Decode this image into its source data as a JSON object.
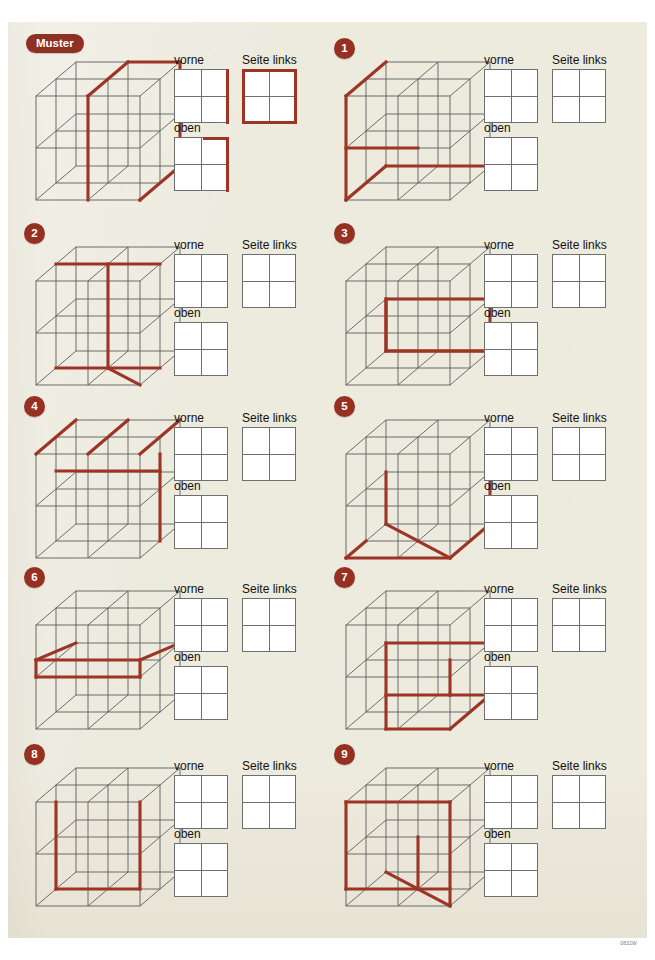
{
  "page": {
    "background_color": "#edeade",
    "accent_color": "#9c3526",
    "badge_color": "#963122",
    "line_color": "#5d5d5d",
    "footer_code": "0832W"
  },
  "labels": {
    "vorne": "vorne",
    "seite_links": "Seite links",
    "oben": "oben",
    "muster": "Muster"
  },
  "items": [
    {
      "id": "muster",
      "badge": "Muster",
      "badge_type": "pill",
      "description": "Example: a vertical slice plane through the cube is highlighted; the right face and a vertical mid-plane edge are traced in red.",
      "answers": {
        "vorne": {
          "edges": [
            "right"
          ]
        },
        "seite_links": {
          "edges": [
            "top",
            "right",
            "bottom",
            "left"
          ]
        },
        "oben": {
          "edges": [
            "tophalf-right",
            "right"
          ]
        }
      }
    },
    {
      "id": "1",
      "badge": "1",
      "badge_type": "circle",
      "description": "Red path along left-front vertical, mid horizontal to the right, and bottom front edge.",
      "answers": {
        "vorne": {
          "edges": []
        },
        "seite_links": {
          "edges": []
        },
        "oben": {
          "edges": []
        }
      }
    },
    {
      "id": "2",
      "badge": "2",
      "badge_type": "circle",
      "description": "Red path: upper horizontal across the top, central vertical down, lower horizontal and a diagonal depth edge.",
      "answers": {
        "vorne": {
          "edges": []
        },
        "seite_links": {
          "edges": []
        },
        "oben": {
          "edges": []
        }
      }
    },
    {
      "id": "3",
      "badge": "3",
      "badge_type": "circle",
      "description": "Red rectangle outlining the right-lower quadrant region of the front square.",
      "answers": {
        "vorne": {
          "edges": []
        },
        "seite_links": {
          "edges": []
        },
        "oben": {
          "edges": []
        }
      }
    },
    {
      "id": "4",
      "badge": "4",
      "badge_type": "circle",
      "description": "Red path along the top back edge with two depth diagonals and a vertical drop on the right.",
      "answers": {
        "vorne": {
          "edges": []
        },
        "seite_links": {
          "edges": []
        },
        "oben": {
          "edges": []
        }
      }
    },
    {
      "id": "5",
      "badge": "5",
      "badge_type": "circle",
      "description": "Red path along the bottom front edge, a depth diagonal and the right vertical edge.",
      "answers": {
        "vorne": {
          "edges": []
        },
        "seite_links": {
          "edges": []
        },
        "oben": {
          "edges": []
        }
      }
    },
    {
      "id": "6",
      "badge": "6",
      "badge_type": "circle",
      "description": "Red parallelogram marking a horizontal mid plane inside the cube.",
      "answers": {
        "vorne": {
          "edges": []
        },
        "seite_links": {
          "edges": []
        },
        "oben": {
          "edges": []
        }
      }
    },
    {
      "id": "7",
      "badge": "7",
      "badge_type": "circle",
      "description": "Red path forming a hook: top horizontal, short vertical, mid horizontal, long vertical to the bottom and a diagonal.",
      "answers": {
        "vorne": {
          "edges": []
        },
        "seite_links": {
          "edges": []
        },
        "oben": {
          "edges": []
        }
      }
    },
    {
      "id": "8",
      "badge": "8",
      "badge_type": "circle",
      "description": "Red U shape: two verticals joined by a horizontal at the bottom of the front square.",
      "answers": {
        "vorne": {
          "edges": []
        },
        "seite_links": {
          "edges": []
        },
        "oben": {
          "edges": []
        }
      }
    },
    {
      "id": "9",
      "badge": "9",
      "badge_type": "circle",
      "description": "Red path around the left/top of the cube with an inner vertical and a depth diagonal at the bottom.",
      "answers": {
        "vorne": {
          "edges": []
        },
        "seite_links": {
          "edges": []
        },
        "oben": {
          "edges": []
        }
      }
    }
  ]
}
